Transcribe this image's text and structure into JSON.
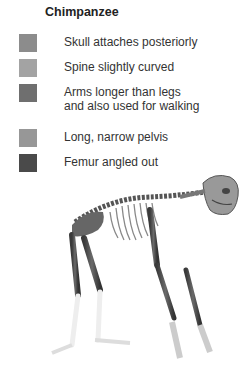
{
  "title": "Chimpanzee",
  "legend": [
    {
      "label": "Skull attaches posteriorly",
      "color": "#8c8c8c"
    },
    {
      "label": "Spine slightly curved",
      "color": "#a3a3a3"
    },
    {
      "label": "Arms longer than legs and also used for walking",
      "color": "#6f6f6f"
    },
    {
      "label": "Long, narrow pelvis",
      "color": "#979797"
    },
    {
      "label": "Femur angled out",
      "color": "#4a4a4a"
    }
  ],
  "illustration": {
    "subject": "chimpanzee skeleton, quadrupedal knuckle-walking stance"
  }
}
